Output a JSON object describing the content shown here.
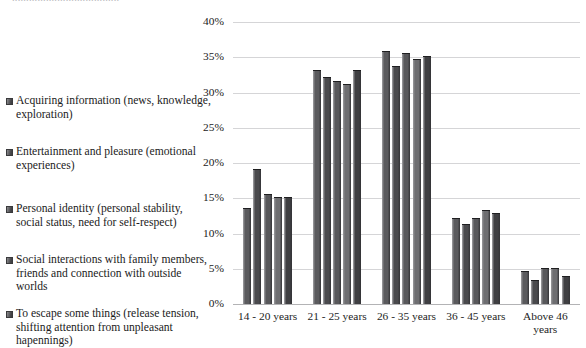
{
  "top_clipped_text": "......................................",
  "legend": {
    "items": [
      {
        "label": "Acquiring information (news, knowledge, exploration)",
        "swatch": "#5a5a5d"
      },
      {
        "label": "Entertainment and pleasure (emotional experiences)",
        "swatch": "#4a4a4d"
      },
      {
        "label": "Personal identity (personal stability, social status, need for self-respect)",
        "swatch": "#58585b"
      },
      {
        "label": "Social interactions with family members, friends and connection with outside worlds",
        "swatch": "#6e6e71"
      },
      {
        "label": "To escape some things (release tension, shifting attention from unpleasant hapennings)",
        "swatch": "#3f3f42"
      }
    ]
  },
  "axis": {
    "y_ticks": [
      "40%",
      "35%",
      "30%",
      "25%",
      "20%",
      "15%",
      "10%",
      "5%",
      "0%"
    ],
    "x_labels": [
      "14 - 20 years",
      "21 - 25 years",
      "26 - 35 years",
      "36 - 45 years",
      "Above 46\nyears"
    ]
  },
  "chart_data": {
    "type": "bar",
    "title": "",
    "xlabel": "",
    "ylabel": "",
    "ylim": [
      0,
      40
    ],
    "ytick_step": 5,
    "ytick_suffix": "%",
    "grid": true,
    "legend_position": "left",
    "categories": [
      "14 - 20 years",
      "21 - 25 years",
      "26 - 35 years",
      "36 - 45 years",
      "Above 46 years"
    ],
    "series": [
      {
        "name": "Acquiring information (news, knowledge, exploration)",
        "color": "#5a5a5d",
        "values": [
          13.5,
          33.0,
          35.7,
          12.0,
          4.6
        ]
      },
      {
        "name": "Entertainment and pleasure (emotional experiences)",
        "color": "#4a4a4d",
        "values": [
          19.0,
          32.0,
          33.6,
          11.2,
          3.2
        ]
      },
      {
        "name": "Personal identity (personal stability, social status, need for self-respect)",
        "color": "#58585b",
        "values": [
          15.5,
          31.5,
          35.5,
          12.0,
          4.9
        ]
      },
      {
        "name": "Social interactions with family members, friends and connection with outside worlds",
        "color": "#6e6e71",
        "values": [
          15.0,
          31.0,
          34.6,
          13.2,
          4.9
        ]
      },
      {
        "name": "To escape some things (release tension, shifting attention from unpleasant hapennings)",
        "color": "#3f3f42",
        "values": [
          15.0,
          33.0,
          35.0,
          12.8,
          3.8
        ]
      }
    ]
  }
}
